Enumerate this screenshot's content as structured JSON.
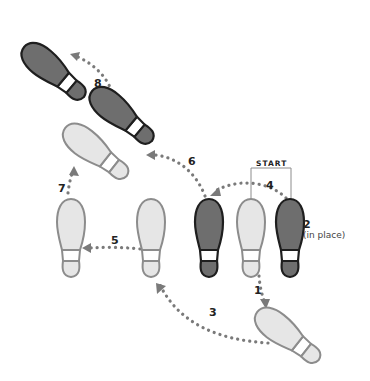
{
  "diagram": {
    "start_label": "START",
    "colors": {
      "dark_fill": "#6e6e6e",
      "dark_stroke": "#1e1e1e",
      "light_fill": "#e6e6e6",
      "light_stroke": "#8c8c8c",
      "path_dots": "#7a7a7a",
      "bracket": "#8c8c8c",
      "text": "#222222"
    },
    "steps": [
      {
        "number": "1",
        "label": "1",
        "note": ""
      },
      {
        "number": "2",
        "label": "2",
        "note": "(in place)"
      },
      {
        "number": "3",
        "label": "3",
        "note": ""
      },
      {
        "number": "4",
        "label": "4",
        "note": ""
      },
      {
        "number": "5",
        "label": "5",
        "note": ""
      },
      {
        "number": "6",
        "label": "6",
        "note": ""
      },
      {
        "number": "7",
        "label": "7",
        "note": ""
      },
      {
        "number": "8",
        "label": "8",
        "note": ""
      }
    ],
    "footprints": [
      {
        "id": "start-right",
        "foot": "right",
        "shade": "dark"
      },
      {
        "id": "start-left",
        "foot": "left",
        "shade": "light"
      },
      {
        "id": "step4-right",
        "foot": "right",
        "shade": "dark"
      },
      {
        "id": "step3-left",
        "foot": "left",
        "shade": "light"
      },
      {
        "id": "step5-left",
        "foot": "left",
        "shade": "light"
      },
      {
        "id": "step1-left",
        "foot": "left",
        "shade": "light"
      },
      {
        "id": "step7-left",
        "foot": "left",
        "shade": "light"
      },
      {
        "id": "step6-right",
        "foot": "right",
        "shade": "dark"
      },
      {
        "id": "step8-right",
        "foot": "right",
        "shade": "dark"
      }
    ]
  }
}
